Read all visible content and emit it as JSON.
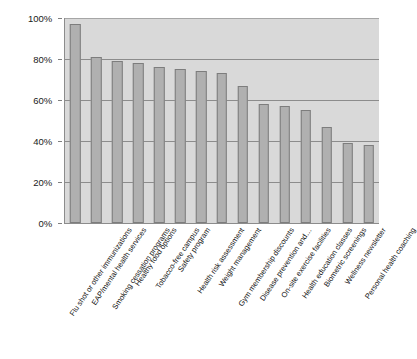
{
  "chart_data": {
    "type": "bar",
    "title": "",
    "xlabel": "",
    "ylabel": "",
    "ylim": [
      0,
      100
    ],
    "grid": true,
    "legend": false,
    "orientation": "vertical",
    "value_unit": "percent",
    "y_ticks": [
      "0%",
      "20%",
      "40%",
      "60%",
      "80%",
      "100%"
    ],
    "y_tick_values": [
      0,
      20,
      40,
      60,
      80,
      100
    ],
    "categories": [
      "Flu shot or other immunizations",
      "EAP/mental health services",
      "Smoking cessation programs",
      "Healthy food options",
      "Tobacco-free campus",
      "Safety program",
      "Health risk assessment",
      "Weight management",
      "Gym membership discounts",
      "Disease prevention and…",
      "On-site exercise facilities",
      "Health education classes",
      "Biometric screenings",
      "Wellness newsletter",
      "Personal health coaching"
    ],
    "values": [
      97,
      81,
      79,
      78,
      76,
      75,
      74,
      73,
      67,
      58,
      57,
      55,
      47,
      39,
      38
    ],
    "colors": {
      "bar_fill": "#b0b0b0",
      "bar_border": "#7d7d7d",
      "plot_background": "#d9d9d9",
      "gridline": "#8c8c8c",
      "axis": "#8c8c8c",
      "text": "#111111",
      "page_background": "#ffffff"
    }
  }
}
